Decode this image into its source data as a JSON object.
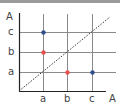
{
  "diagram": {
    "y_axis_label": "A",
    "x_axis_label": "A",
    "y_ticks": [
      "c",
      "b",
      "a"
    ],
    "x_ticks": [
      "a",
      "b",
      "c"
    ],
    "colors": {
      "blue": "#2f4f8f",
      "red": "#e85050",
      "grid": "#888888",
      "axis": "#222222"
    },
    "points": [
      {
        "x": "a",
        "y": "c",
        "color": "blue"
      },
      {
        "x": "a",
        "y": "b",
        "color": "red"
      },
      {
        "x": "b",
        "y": "a",
        "color": "red"
      },
      {
        "x": "c",
        "y": "a",
        "color": "blue"
      }
    ],
    "diagonal": "dotted identity line"
  }
}
